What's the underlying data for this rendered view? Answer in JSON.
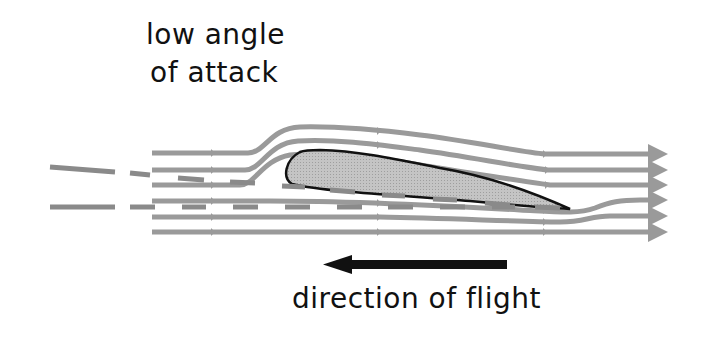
{
  "title": {
    "line1": "low angle",
    "line2": "of attack"
  },
  "caption": "direction of flight",
  "colors": {
    "streamline": "#9a9a9a",
    "airfoil_fill": "#bdbdbd",
    "airfoil_outline": "#111111",
    "arrow": "#111111",
    "chord_dash": "#8a8a8a",
    "background": "#ffffff"
  },
  "diagram": {
    "streamline_count": 6,
    "arrow_direction": "left"
  }
}
